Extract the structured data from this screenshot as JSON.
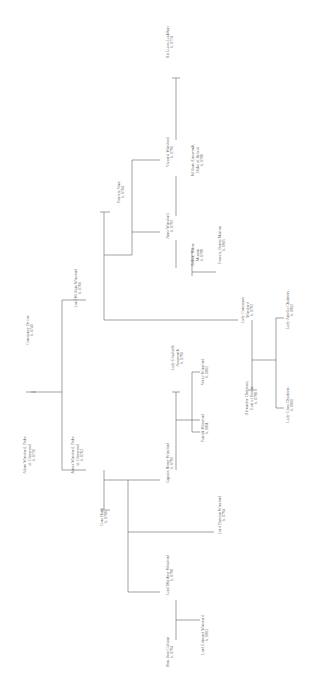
{
  "figure": {
    "type": "genealogy-chart",
    "orientation": "rotated-90-ccw",
    "background": "#ffffff",
    "line_color": "#7a7876",
    "text_color": "#63605f"
  },
  "chart_data": {
    "type": "diagram",
    "title": "",
    "nodes": [
      {
        "id": "adam",
        "name": "Adam Winsford, Duke",
        "name2": "of Glenwood",
        "year": "b. 1730",
        "x": 30,
        "y": 455
      },
      {
        "id": "constance",
        "name": "Constance Devon",
        "name2": "",
        "year": "b. 1740",
        "x": 30,
        "y": 330
      },
      {
        "id": "james",
        "name": "James Winsford, Duke",
        "name2": "of Glenwood",
        "year": "b. 1762",
        "x": 78,
        "y": 455
      },
      {
        "id": "william",
        "name": "Lord William Winsford",
        "name2": "",
        "year": "b. 1761",
        "x": 78,
        "y": 288
      },
      {
        "id": "patricia",
        "name": "Patricia Vane",
        "name2": "",
        "year": "b. 1764",
        "x": 121,
        "y": 192
      },
      {
        "id": "victoria",
        "name": "Victoria Winsford",
        "name2": "",
        "year": "b. 1791",
        "x": 170,
        "y": 152
      },
      {
        "id": "lucas",
        "name": "Sir Lucas Lockhart",
        "name2": "",
        "year": "b. 1774",
        "x": 170,
        "y": 42
      },
      {
        "id": "anne",
        "name": "Anne Winsford",
        "name2": "",
        "year": "b. 1793",
        "x": 170,
        "y": 226
      },
      {
        "id": "wmains",
        "name": "William Ainsworth,",
        "name2": "Duke of Bristol",
        "year": "b. 1786",
        "x": 198,
        "y": 160
      },
      {
        "id": "arthur",
        "name": "Arthur, Baron",
        "name2": "Murton",
        "year": "b. 1789",
        "x": 198,
        "y": 255
      },
      {
        "id": "francis",
        "name": "Francis, Baron Murton",
        "name2": "",
        "year": "b. 1805",
        "x": 222,
        "y": 245
      },
      {
        "id": "cora",
        "name": "Cora Hurst",
        "name2": "",
        "year": "b. 1766",
        "x": 104,
        "y": 517
      },
      {
        "id": "henry",
        "name": "Captain Henry Winsford",
        "name2": "",
        "year": "b. 1790",
        "x": 170,
        "y": 463
      },
      {
        "id": "elizabeth",
        "name": "Lady Elizabeth",
        "name2": "Ainsworth",
        "year": "b. 1791",
        "x": 178,
        "y": 358
      },
      {
        "id": "verity",
        "name": "Verity Winsford",
        "name2": "",
        "year": "b. 1812",
        "x": 205,
        "y": 372
      },
      {
        "id": "patrick",
        "name": "Patrick Winsford",
        "name2": "",
        "year": "b. 1811",
        "x": 205,
        "y": 428
      },
      {
        "id": "damian",
        "name": "Lord Damian Winsford",
        "name2": "",
        "year": "b. 1794",
        "x": 222,
        "y": 515
      },
      {
        "id": "matthew",
        "name": "Lord Matthew Winsford",
        "name2": "",
        "year": "b. 1796",
        "x": 170,
        "y": 575
      },
      {
        "id": "jane",
        "name": "Hon. Jane Colston",
        "name2": "",
        "year": "b. 1794",
        "x": 170,
        "y": 652
      },
      {
        "id": "edmund",
        "name": "Lord Edmund Winsford",
        "name2": "",
        "year": "b. 1812",
        "x": 205,
        "y": 635
      },
      {
        "id": "lconst",
        "name": "Lady Constance",
        "name2": "Winsford",
        "year": "b. 1792",
        "x": 248,
        "y": 310
      },
      {
        "id": "alex",
        "name": "Alexander Chalmers,",
        "name2": "Earl of Sutton",
        "year": "b. 1786",
        "x": 252,
        "y": 398
      },
      {
        "id": "amelia",
        "name": "Lady Amelia Chalmers",
        "name2": "",
        "year": "b. 1812",
        "x": 290,
        "y": 310
      },
      {
        "id": "clara",
        "name": "Lady Clara Chalmers",
        "name2": "",
        "year": "b. 1810",
        "x": 290,
        "y": 405
      }
    ],
    "edges": [
      "adam-constance-marriage",
      "adam-james-child",
      "adam-william-child",
      "william-patricia-marriage",
      "william-victoria-child",
      "william-anne-child",
      "william-lconst-child",
      "victoria-lucas-marriage",
      "anne-wmains-marriage",
      "anne-arthur-marriage",
      "arthur-francis-child",
      "james-cora-marriage",
      "james-henry-child",
      "james-damian-child",
      "james-matthew-child",
      "henry-elizabeth-marriage",
      "henry-verity-child",
      "henry-patrick-child",
      "matthew-jane-marriage",
      "matthew-edmund-child",
      "lconst-alex-marriage",
      "alex-amelia-child",
      "alex-clara-child"
    ]
  }
}
